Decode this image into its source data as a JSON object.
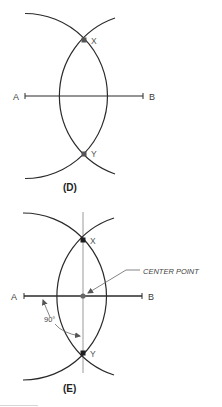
{
  "figure": {
    "panels": [
      {
        "id": "D",
        "caption": "(D)",
        "line_endpoints": {
          "left": "A",
          "right": "B"
        },
        "points": {
          "top": "X",
          "bottom": "Y"
        }
      },
      {
        "id": "E",
        "caption": "(E)",
        "line_endpoints": {
          "left": "A",
          "right": "B"
        },
        "points": {
          "top": "X",
          "bottom": "Y"
        },
        "annotations": {
          "center": "CENTER POINT",
          "angle": "90°"
        }
      }
    ],
    "colors": {
      "stroke": "#2a2a2a",
      "construction_line": "#9a9a9a",
      "point": "#333333"
    }
  }
}
